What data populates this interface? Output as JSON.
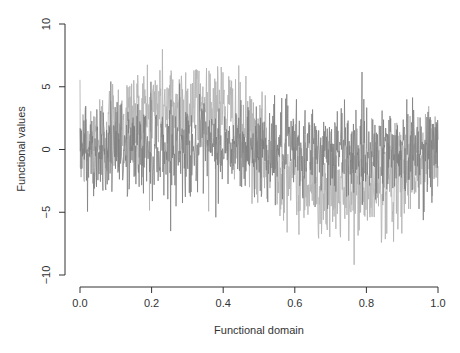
{
  "chart_data": {
    "type": "line",
    "title": "",
    "xlabel": "Functional domain",
    "ylabel": "Functional values",
    "xlim": [
      0.0,
      1.0
    ],
    "ylim": [
      -10,
      10
    ],
    "x_ticks": [
      "0.0",
      "0.2",
      "0.4",
      "0.6",
      "0.8",
      "1.0"
    ],
    "y_ticks": [
      "-10",
      "-5",
      "0",
      "5",
      "10"
    ],
    "grid": false,
    "legend": null,
    "series": [
      {
        "name": "curve-light",
        "color": "#b4b4b4",
        "description": "Noisy sinusoidal function: mean ~ 3.5*sin(2*pi*x), noise sd ~ 2",
        "mean_points": {
          "x": [
            0.0,
            0.1,
            0.2,
            0.3,
            0.35,
            0.4,
            0.5,
            0.6,
            0.7,
            0.75,
            0.8,
            0.9,
            1.0
          ],
          "y": [
            0.0,
            2.0,
            3.3,
            3.5,
            3.5,
            3.3,
            0.0,
            -2.0,
            -3.3,
            -3.5,
            -3.3,
            -2.0,
            0.0
          ]
        },
        "noise_sd": 2.0,
        "range_approx": [
          -9.2,
          9.3
        ]
      },
      {
        "name": "curve-dark",
        "color": "#7e7e7e",
        "description": "Noisy function centered near zero, noise sd ~ 1.8",
        "mean_points": {
          "x": [
            0.0,
            0.5,
            1.0
          ],
          "y": [
            0.0,
            0.0,
            0.0
          ]
        },
        "noise_sd": 1.8,
        "range_approx": [
          -6.5,
          7.0
        ]
      }
    ],
    "n_points": 1000
  },
  "plot": {
    "axis_color": "#333333"
  }
}
